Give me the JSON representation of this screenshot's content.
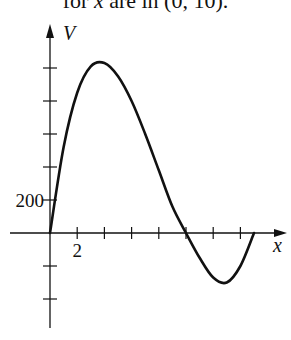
{
  "caption": {
    "prefix": "for ",
    "var": "x",
    "suffix": " are in (0, 10)."
  },
  "chart_data": {
    "type": "line",
    "title": "",
    "xlabel": "x",
    "ylabel": "V",
    "x_tick_labels": [
      {
        "x": 2,
        "label": "2"
      }
    ],
    "y_tick_labels": [
      {
        "y": 200,
        "label": "200"
      }
    ],
    "x_ticks": [
      2,
      4,
      6,
      8,
      10,
      12,
      14
    ],
    "y_ticks": [
      -400,
      -200,
      200,
      400,
      600,
      800,
      1000
    ],
    "xlim": [
      0,
      17
    ],
    "ylim": [
      -560,
      1250
    ],
    "grid": false,
    "series": [
      {
        "name": "V(x)",
        "x": [
          0,
          1,
          2,
          3,
          4,
          5,
          6,
          7,
          8,
          9,
          10,
          11,
          12,
          13,
          14,
          15
        ],
        "values": [
          0,
          520,
          850,
          1010,
          1030,
          950,
          800,
          600,
          380,
          160,
          0,
          -150,
          -270,
          -300,
          -200,
          0
        ]
      }
    ]
  }
}
